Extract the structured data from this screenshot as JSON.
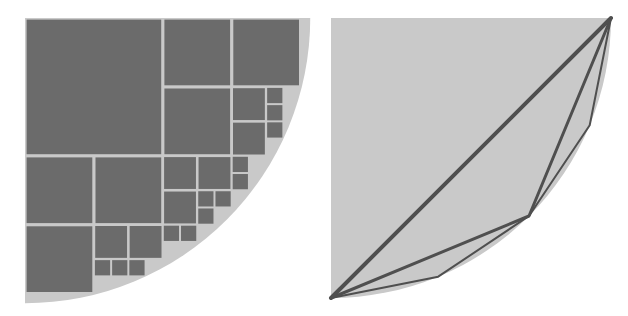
{
  "diagram": {
    "colors": {
      "disc_fill": "#c9c9c9",
      "square_fill": "#6b6b6b",
      "polygon_stroke": "#4f4f4f",
      "background": "#ffffff"
    },
    "left": {
      "origin": [
        25,
        18
      ],
      "unit": 34.45,
      "radius_units": 8.28,
      "squares": [
        {
          "col": 0,
          "row": 0,
          "size": 4
        },
        {
          "col": 4,
          "row": 0,
          "size": 2
        },
        {
          "col": 6,
          "row": 0,
          "size": 2
        },
        {
          "col": 4,
          "row": 2,
          "size": 2
        },
        {
          "col": 6,
          "row": 2,
          "size": 1
        },
        {
          "col": 6,
          "row": 3,
          "size": 1
        },
        {
          "col": 7,
          "row": 2,
          "size": 0.5
        },
        {
          "col": 7,
          "row": 2.5,
          "size": 0.5
        },
        {
          "col": 7,
          "row": 3,
          "size": 0.5
        },
        {
          "col": 0,
          "row": 4,
          "size": 2
        },
        {
          "col": 2,
          "row": 4,
          "size": 2
        },
        {
          "col": 4,
          "row": 4,
          "size": 1
        },
        {
          "col": 5,
          "row": 4,
          "size": 1
        },
        {
          "col": 4,
          "row": 5,
          "size": 1
        },
        {
          "col": 5,
          "row": 5,
          "size": 0.5
        },
        {
          "col": 5.5,
          "row": 5,
          "size": 0.5
        },
        {
          "col": 5,
          "row": 5.5,
          "size": 0.5
        },
        {
          "col": 6,
          "row": 4,
          "size": 0.5
        },
        {
          "col": 6,
          "row": 4.5,
          "size": 0.5
        },
        {
          "col": 0,
          "row": 6,
          "size": 2
        },
        {
          "col": 2,
          "row": 6,
          "size": 1
        },
        {
          "col": 3,
          "row": 6,
          "size": 1
        },
        {
          "col": 2,
          "row": 7,
          "size": 0.5
        },
        {
          "col": 2.5,
          "row": 7,
          "size": 0.5
        },
        {
          "col": 3,
          "row": 7,
          "size": 0.5
        },
        {
          "col": 4,
          "row": 6,
          "size": 0.5
        },
        {
          "col": 4.5,
          "row": 6,
          "size": 0.5
        }
      ]
    },
    "right": {
      "center": [
        17,
        18
      ],
      "radius": 280,
      "polygon_levels": [
        {
          "angles_deg": [
            0,
            90
          ],
          "stroke_width": 4
        },
        {
          "angles_deg": [
            0,
            45,
            90
          ],
          "stroke_width": 3
        },
        {
          "angles_deg": [
            0,
            22.5,
            45,
            67.5,
            90
          ],
          "stroke_width": 2
        }
      ]
    }
  }
}
